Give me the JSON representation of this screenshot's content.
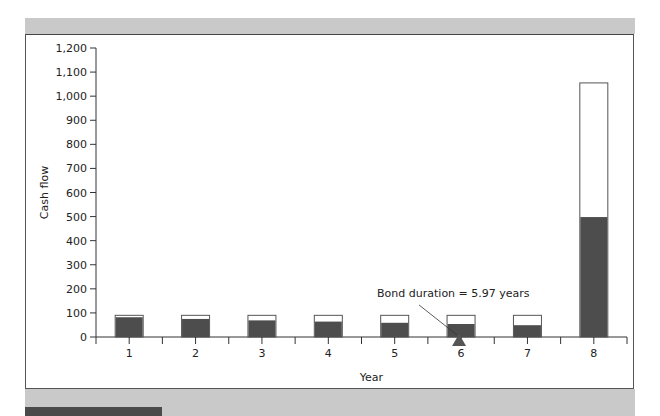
{
  "chart_data": {
    "type": "bar",
    "stacked": true,
    "title": "",
    "xlabel": "Year",
    "ylabel": "Cash flow",
    "ylim": [
      0,
      1200
    ],
    "yticks": [
      "0",
      "100",
      "200",
      "300",
      "400",
      "500",
      "600",
      "700",
      "800",
      "900",
      "1,000",
      "1,100",
      "1,200"
    ],
    "categories": [
      "1",
      "2",
      "3",
      "4",
      "5",
      "6",
      "7",
      "8"
    ],
    "series": [
      {
        "name": "Present value of cash flow",
        "color": "#4d4d4d",
        "values": [
          82,
          75,
          69,
          64,
          59,
          54,
          49,
          498
        ]
      },
      {
        "name": "Cash flow",
        "color": "#ffffff",
        "values": [
          90,
          90,
          90,
          90,
          90,
          90,
          90,
          1055
        ]
      }
    ],
    "annotations": [
      {
        "text": "Bond duration = 5.97 years",
        "x": 5.97,
        "marker": "triangle"
      }
    ],
    "grid": false,
    "legend": "none"
  },
  "labels": {
    "ylabel": "Cash flow",
    "xlabel": "Year",
    "annotation": "Bond duration = 5.97 years"
  }
}
